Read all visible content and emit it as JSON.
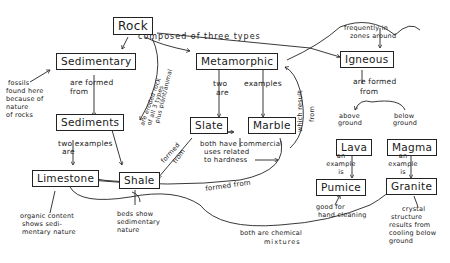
{
  "diagram": {
    "type": "concept-map",
    "style": "hand-drawn",
    "nodes": {
      "rock": "Rock",
      "sedimentary": "Sedimentary",
      "metamorphic": "Metamorphic",
      "igneous": "Igneous",
      "sediments": "Sediments",
      "slate": "Slate",
      "marble": "Marble",
      "lava": "Lava",
      "magma": "Magma",
      "pumice": "Pumice",
      "granite": "Granite",
      "limestone": "Limestone",
      "shale": "Shale"
    },
    "links": {
      "composed": "composed of three types",
      "frequently_1": "frequently in",
      "frequently_2": "zones around",
      "sed_formed_1": "are formed",
      "sed_formed_2": "from",
      "ign_formed_1": "are formed",
      "ign_formed_2": "from",
      "fossils_1": "fossils",
      "fossils_2": "found here",
      "fossils_3": "because of",
      "fossils_4": "nature",
      "fossils_5": "of rocks",
      "eroded_1": "are eroded rock",
      "eroded_2": "of all 3 types",
      "eroded_3": "plus plant/animal",
      "meta_two_1": "two",
      "meta_two_2": "are",
      "meta_examples": "examples",
      "which_result_1": "which result",
      "which_result_2": "from",
      "sed_two_1": "two examples",
      "sed_two_2": "are",
      "slate_formed_1": "formed",
      "slate_formed_2": "from",
      "commercial_1": "both have commercial",
      "commercial_2": "uses related",
      "commercial_3": "to hardness",
      "formed_from": "formed from",
      "above_1": "above",
      "above_2": "ground",
      "below_1": "below",
      "below_2": "ground",
      "lava_ex_1": "an",
      "lava_ex_2": "example",
      "lava_ex_3": "is",
      "magma_ex_1": "an",
      "magma_ex_2": "example",
      "magma_ex_3": "is",
      "pumice_1": "good   for",
      "pumice_2": "hand cleaning",
      "granite_1": "crystal",
      "granite_2": "structure",
      "granite_3": "results from",
      "granite_4": "cooling below",
      "granite_5": "ground",
      "organic_1": "organic content",
      "organic_2": "shows sedi-",
      "organic_3": "mentary nature",
      "beds_1": "beds show",
      "beds_2": "sedimentary",
      "beds_3": "nature",
      "chemical_1": "both are chemical",
      "chemical_2": "mixtures"
    }
  }
}
